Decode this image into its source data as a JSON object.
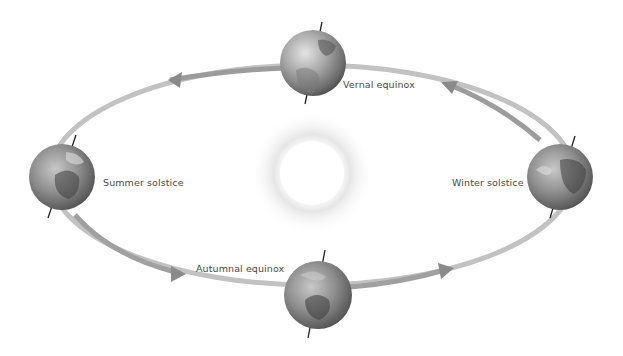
{
  "diagram": {
    "type": "earth-orbit-seasons",
    "sun": {
      "cx": 312,
      "cy": 173,
      "r": 32
    },
    "orbit": {
      "cx": 312,
      "cy": 175,
      "rx": 262,
      "ry": 110,
      "color": "#b5b5b5"
    },
    "labels": {
      "vernal": "Vernal equinox",
      "summer": "Summer solstice",
      "winter": "Winter solstice",
      "autumnal": "Autumnal equinox"
    },
    "globes": [
      {
        "name": "vernal",
        "cx": 313,
        "cy": 63,
        "r": 33
      },
      {
        "name": "summer",
        "cx": 62,
        "cy": 177,
        "r": 33
      },
      {
        "name": "winter",
        "cx": 560,
        "cy": 177,
        "r": 33
      },
      {
        "name": "autumnal",
        "cx": 318,
        "cy": 295,
        "r": 34
      }
    ]
  }
}
